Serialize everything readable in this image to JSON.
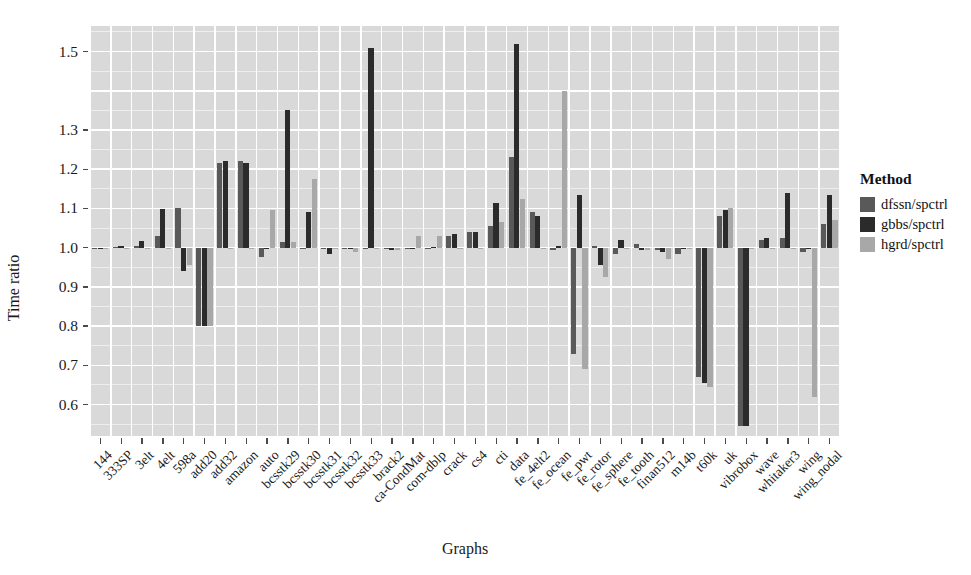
{
  "chart_data": {
    "type": "bar",
    "title": "",
    "xlabel": "Graphs",
    "ylabel": "Time ratio",
    "grid": true,
    "legend_position": "right",
    "legend_title": "Method",
    "ylim": [
      0.52,
      1.565
    ],
    "yticks": [
      0.6,
      0.7,
      0.8,
      0.9,
      1.0,
      1.1,
      1.2,
      1.3,
      1.5
    ],
    "ytick_labels": [
      "0.6",
      "0.7",
      "0.8",
      "0.9",
      "1.0",
      "1.1",
      "1.2",
      "1.3",
      "1.5"
    ],
    "baseline": 1.0,
    "categories": [
      "144",
      "333SP",
      "3elt",
      "4elt",
      "598a",
      "add20",
      "add32",
      "amazon",
      "auto",
      "bcsstk29",
      "bcsstk30",
      "bcsstk31",
      "bcsstk32",
      "bcsstk33",
      "brack2",
      "ca-CondMat",
      "com-dblp",
      "crack",
      "cs4",
      "cti",
      "data",
      "fe_4elt2",
      "fe_ocean",
      "fe_pwt",
      "fe_rotor",
      "fe_sphere",
      "fe_tooth",
      "finan512",
      "m14b",
      "t60k",
      "uk",
      "vibrobox",
      "wave",
      "whitaker3",
      "wing",
      "wing_nodal"
    ],
    "series": [
      {
        "name": "dfssn/spctrl",
        "color": "#595959",
        "values": [
          1.0,
          1.002,
          1.005,
          1.03,
          1.1,
          0.8,
          1.215,
          1.22,
          0.975,
          1.015,
          1.0,
          1.0,
          1.0,
          1.0,
          1.0,
          1.0,
          1.0,
          1.03,
          1.04,
          1.055,
          1.23,
          1.09,
          0.995,
          0.73,
          1.005,
          0.985,
          1.01,
          0.995,
          0.985,
          0.67,
          1.08,
          0.545,
          1.02,
          1.025,
          0.99,
          1.06
        ]
      },
      {
        "name": "gbbs/spctrl",
        "color": "#2b2b2b",
        "values": [
          1.0,
          1.005,
          1.018,
          1.098,
          0.94,
          0.8,
          1.22,
          1.215,
          1.0,
          1.35,
          1.09,
          0.985,
          1.0,
          1.51,
          0.995,
          1.0,
          1.002,
          1.035,
          1.04,
          1.115,
          1.52,
          1.08,
          1.005,
          1.135,
          0.955,
          1.02,
          0.995,
          0.99,
          1.0,
          0.655,
          1.095,
          0.545,
          1.025,
          1.14,
          1.0,
          1.135
        ]
      },
      {
        "name": "hgrd/spctrl",
        "color": "#a8a8a8",
        "values": [
          0.998,
          1.0,
          1.0,
          1.0,
          0.955,
          0.8,
          1.0,
          1.0,
          1.095,
          1.015,
          1.175,
          1.0,
          0.99,
          1.0,
          0.995,
          1.03,
          1.03,
          1.0,
          1.0,
          1.065,
          1.125,
          1.0,
          1.4,
          0.69,
          0.925,
          1.0,
          0.995,
          0.97,
          1.0,
          0.645,
          1.1,
          1.0,
          1.0,
          1.0,
          0.62,
          1.07
        ]
      }
    ]
  },
  "axes": {
    "ylabel": "Time ratio",
    "xlabel": "Graphs"
  },
  "legend": {
    "title": "Method",
    "items": [
      {
        "label": "dfssn/spctrl",
        "color": "#595959"
      },
      {
        "label": "gbbs/spctrl",
        "color": "#2b2b2b"
      },
      {
        "label": "hgrd/spctrl",
        "color": "#a8a8a8"
      }
    ]
  },
  "colors": {
    "panel_background": "#d9d9d9",
    "gridline": "#ffffff",
    "text": "#1a1a1a",
    "page_background": "#ffffff"
  }
}
